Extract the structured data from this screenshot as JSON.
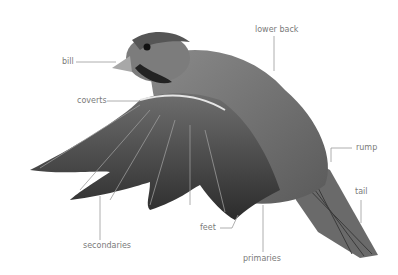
{
  "diagram": {
    "colors": {
      "line": "#9a9a9a",
      "label": "#7a7a7a",
      "background": "#ffffff"
    },
    "labels": [
      {
        "id": "bill",
        "text": "bill"
      },
      {
        "id": "lower-back",
        "text": "lower back"
      },
      {
        "id": "coverts",
        "text": "coverts"
      },
      {
        "id": "rump",
        "text": "rump"
      },
      {
        "id": "tail",
        "text": "tail"
      },
      {
        "id": "feet",
        "text": "feet"
      },
      {
        "id": "primaries",
        "text": "primaries"
      },
      {
        "id": "secondaries",
        "text": "secondaries"
      }
    ]
  }
}
